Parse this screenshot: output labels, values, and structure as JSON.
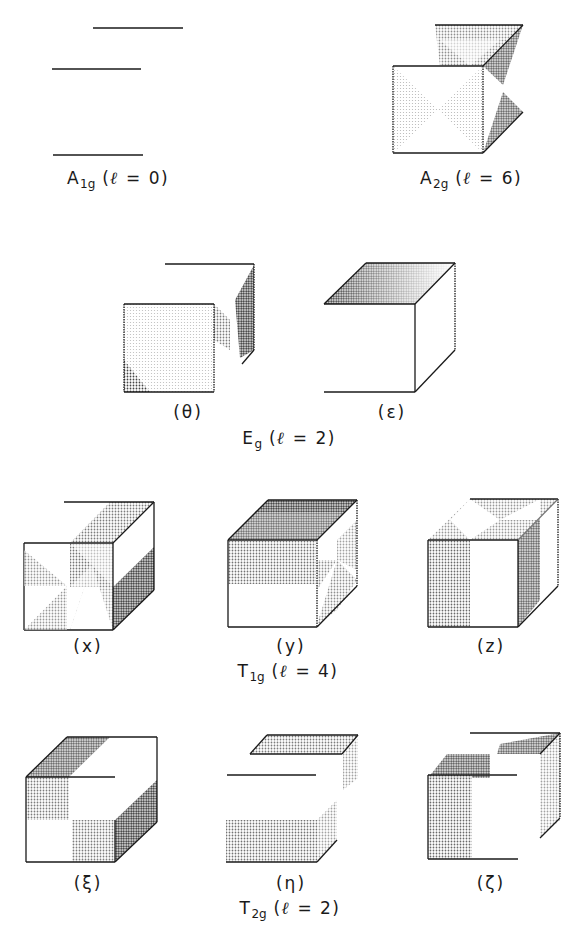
{
  "colors": {
    "ink": "#1a1a1a",
    "shade": "#555555",
    "background": "#ffffff"
  },
  "groups": [
    {
      "id": "A1g",
      "symbol": "A",
      "subscript": "1g",
      "l_label": "ℓ",
      "l_eq": "= 0)",
      "caption_open": "(",
      "panels": []
    },
    {
      "id": "A2g",
      "symbol": "A",
      "subscript": "2g",
      "l_label": "ℓ",
      "l_eq": "= 6)",
      "caption_open": "(",
      "panels": []
    },
    {
      "id": "Eg",
      "symbol": "E",
      "subscript": "g",
      "l_label": "ℓ",
      "l_eq": "= 2)",
      "caption_open": "(",
      "panels": [
        {
          "label": "(θ)"
        },
        {
          "label": "(ε)"
        }
      ]
    },
    {
      "id": "T1g",
      "symbol": "T",
      "subscript": "1g",
      "l_label": "ℓ",
      "l_eq": "= 4)",
      "caption_open": "(",
      "panels": [
        {
          "label": "(x)"
        },
        {
          "label": "(y)"
        },
        {
          "label": "(z)"
        }
      ]
    },
    {
      "id": "T2g",
      "symbol": "T",
      "subscript": "2g",
      "l_label": "ℓ",
      "l_eq": "= 2)",
      "caption_open": "(",
      "panels": [
        {
          "label": "(ξ)"
        },
        {
          "label": "(η)"
        },
        {
          "label": "(ζ)"
        }
      ]
    }
  ]
}
